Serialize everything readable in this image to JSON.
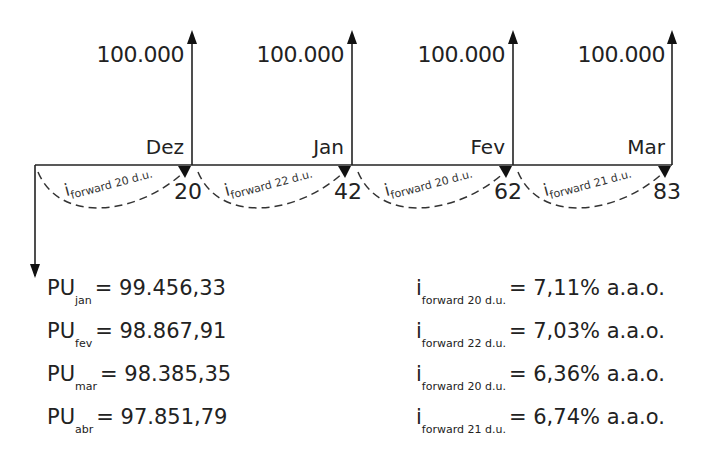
{
  "diagram": {
    "type": "cash-flow-timeline",
    "cash_flows": [
      {
        "month": "Dez",
        "amount": "100.000",
        "day": "20"
      },
      {
        "month": "Jan",
        "amount": "100.000",
        "day": "42"
      },
      {
        "month": "Fev",
        "amount": "100.000",
        "day": "62"
      },
      {
        "month": "Mar",
        "amount": "100.000",
        "day": "83"
      }
    ],
    "forward_arcs": [
      {
        "symbol": "i",
        "sub": "forward 20 d.u."
      },
      {
        "symbol": "i",
        "sub": "forward 22 d.u."
      },
      {
        "symbol": "i",
        "sub": "forward 20 d.u."
      },
      {
        "symbol": "i",
        "sub": "forward 21 d.u."
      }
    ]
  },
  "pu_values": [
    {
      "label": "PU",
      "sub": "jan",
      "value": "= 99.456,33"
    },
    {
      "label": "PU",
      "sub": "fev",
      "value": "= 98.867,91"
    },
    {
      "label": "PU",
      "sub": "mar",
      "value": "= 98.385,35"
    },
    {
      "label": "PU",
      "sub": "abr",
      "value": "= 97.851,79"
    }
  ],
  "forward_rates": [
    {
      "label": "i",
      "sub": "forward 20 d.u.",
      "value": "= 7,11% a.a.o."
    },
    {
      "label": "i",
      "sub": "forward 22 d.u.",
      "value": "= 7,03% a.a.o."
    },
    {
      "label": "i",
      "sub": "forward 20 d.u.",
      "value": "= 6,36% a.a.o."
    },
    {
      "label": "i",
      "sub": "forward 21 d.u.",
      "value": "= 6,74% a.a.o."
    }
  ]
}
